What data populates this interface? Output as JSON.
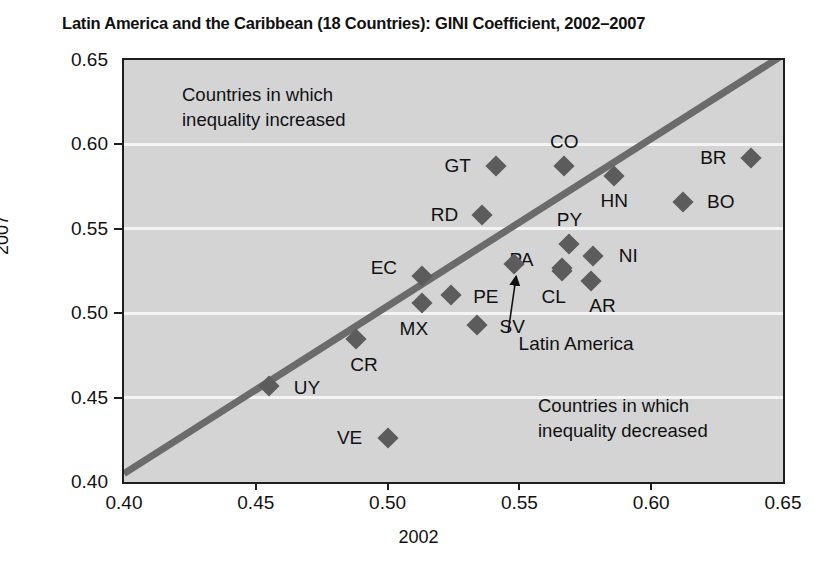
{
  "chart_data": {
    "type": "scatter",
    "title": "Latin America and the Caribbean (18 Countries): GINI Coefficient, 2002–2007",
    "xlabel": "2002",
    "ylabel": "2007",
    "xlim": [
      0.4,
      0.65
    ],
    "ylim": [
      0.4,
      0.65
    ],
    "xticks": [
      "0.40",
      "0.45",
      "0.50",
      "0.55",
      "0.60",
      "0.65"
    ],
    "yticks": [
      "0.40",
      "0.45",
      "0.50",
      "0.55",
      "0.60",
      "0.65"
    ],
    "grid": "horizontal",
    "legend": "none",
    "reference_line": {
      "label": "45-degree line (no change)",
      "from": [
        0.4,
        0.405
      ],
      "to": [
        0.65,
        0.653
      ],
      "color": "#6b6b6b"
    },
    "marker_color": "#5c5c5c",
    "marker_shape": "diamond",
    "plot_background": "#d4d4d4",
    "points": [
      {
        "code": "GT",
        "x": 0.541,
        "y": 0.587,
        "label_dx": -38,
        "label_dy": 0
      },
      {
        "code": "CO",
        "x": 0.567,
        "y": 0.587,
        "label_dx": 0,
        "label_dy": -24
      },
      {
        "code": "BR",
        "x": 0.638,
        "y": 0.592,
        "label_dx": -38,
        "label_dy": 0
      },
      {
        "code": "HN",
        "x": 0.586,
        "y": 0.581,
        "label_dx": 0,
        "label_dy": 25
      },
      {
        "code": "BO",
        "x": 0.612,
        "y": 0.566,
        "label_dx": 38,
        "label_dy": 0
      },
      {
        "code": "RD",
        "x": 0.536,
        "y": 0.558,
        "label_dx": -38,
        "label_dy": 0
      },
      {
        "code": "PY",
        "x": 0.569,
        "y": 0.541,
        "label_dx": 0,
        "label_dy": -24
      },
      {
        "code": "NI",
        "x": 0.578,
        "y": 0.534,
        "label_dx": 35,
        "label_dy": 0
      },
      {
        "code": "PA",
        "x": 0.566,
        "y": 0.527,
        "label_dx": -40,
        "label_dy": -8
      },
      {
        "code": "AR",
        "x": 0.577,
        "y": 0.519,
        "label_dx": 12,
        "label_dy": 25
      },
      {
        "code": "CL",
        "x": 0.566,
        "y": 0.525,
        "label_dx": -8,
        "label_dy": 26
      },
      {
        "code": "EC",
        "x": 0.513,
        "y": 0.522,
        "label_dx": -38,
        "label_dy": -8
      },
      {
        "code": "PE",
        "x": 0.524,
        "y": 0.511,
        "label_dx": 35,
        "label_dy": 2
      },
      {
        "code": "MX",
        "x": 0.513,
        "y": 0.506,
        "label_dx": -8,
        "label_dy": 26
      },
      {
        "code": "SV",
        "x": 0.534,
        "y": 0.493,
        "label_dx": 35,
        "label_dy": 2
      },
      {
        "code": "CR",
        "x": 0.488,
        "y": 0.485,
        "label_dx": 8,
        "label_dy": 26
      },
      {
        "code": "UY",
        "x": 0.455,
        "y": 0.457,
        "label_dx": 38,
        "label_dy": 2
      },
      {
        "code": "VE",
        "x": 0.5,
        "y": 0.426,
        "label_dx": -38,
        "label_dy": 0
      }
    ],
    "highlight_point": {
      "code": "Latin America",
      "x": 0.548,
      "y": 0.529,
      "annotation_text": "Latin America"
    },
    "annotations": [
      {
        "id": "upper",
        "line1": "Countries in which",
        "line2": "inequality increased"
      },
      {
        "id": "lower",
        "line1": "Countries in which",
        "line2": "inequality decreased"
      }
    ]
  }
}
